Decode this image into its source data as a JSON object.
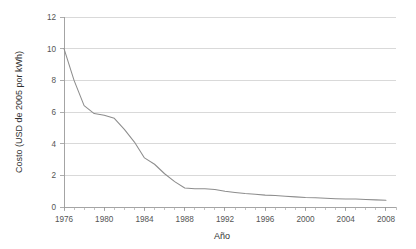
{
  "chart_data": {
    "type": "line",
    "title": "",
    "xlabel": "Año",
    "ylabel": "Costo (USD de 2005 por kWh)",
    "xlim": [
      1976,
      2009
    ],
    "ylim": [
      0,
      12
    ],
    "grid": true,
    "legend": "none",
    "xticks": [
      1976,
      1980,
      1984,
      1988,
      1992,
      1996,
      2000,
      2004,
      2008
    ],
    "xtick_labels": [
      "1976",
      "1980",
      "1984",
      "1988",
      "1992",
      "1996",
      "2000",
      "2004",
      "2008"
    ],
    "yticks": [
      0,
      2,
      4,
      6,
      8,
      10,
      12
    ],
    "ytick_labels": [
      "0",
      "2",
      "4",
      "6",
      "8",
      "10",
      "12"
    ],
    "minor_x_tick_interval": 1,
    "series": [
      {
        "name": "Costo",
        "color": "#8d8d8d",
        "x": [
          1976,
          1977,
          1978,
          1979,
          1980,
          1981,
          1982,
          1983,
          1984,
          1985,
          1986,
          1987,
          1988,
          1989,
          1990,
          1991,
          1992,
          1993,
          1994,
          1995,
          1996,
          1997,
          1998,
          1999,
          2000,
          2001,
          2002,
          2003,
          2004,
          2005,
          2006,
          2007,
          2008
        ],
        "values": [
          10.0,
          8.0,
          6.4,
          5.9,
          5.8,
          5.6,
          4.9,
          4.1,
          3.1,
          2.7,
          2.1,
          1.6,
          1.2,
          1.15,
          1.15,
          1.1,
          1.0,
          0.92,
          0.85,
          0.8,
          0.75,
          0.72,
          0.68,
          0.64,
          0.6,
          0.58,
          0.55,
          0.52,
          0.5,
          0.5,
          0.48,
          0.45,
          0.42
        ]
      }
    ]
  },
  "axes": {
    "y_title": "Costo (USD de 2005 por kWh)",
    "x_title": "Año"
  }
}
